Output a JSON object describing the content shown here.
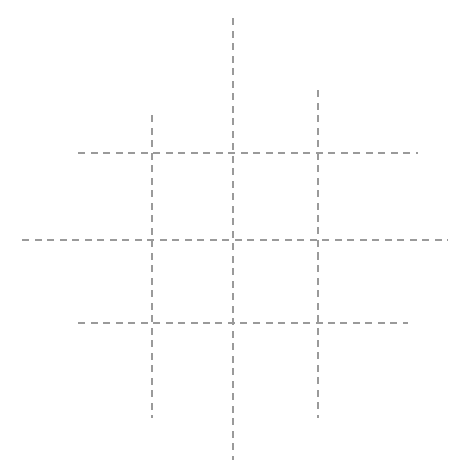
{
  "figure": {
    "background_color": "#ffffff",
    "width": 466,
    "height": 476,
    "caption_partial": "clipped caption text at bottom edge"
  },
  "style": {
    "line_color": "#9a9a9a",
    "line_width": 1.4,
    "dash_on": 7,
    "dash_off": 5.5,
    "linecap": "butt"
  },
  "chart_data": {
    "type": "line",
    "xlabel": "",
    "ylabel": "",
    "xlim": [
      0,
      466
    ],
    "ylim": [
      476,
      0
    ],
    "grid": false,
    "legend": "none",
    "series": [
      {
        "name": "vertical-left",
        "orientation": "vertical",
        "x": 152,
        "y_start": 115,
        "y_end": 418
      },
      {
        "name": "vertical-center",
        "orientation": "vertical",
        "x": 233,
        "y_start": 18,
        "y_end": 460
      },
      {
        "name": "vertical-right",
        "orientation": "vertical",
        "x": 318,
        "y_start": 90,
        "y_end": 418
      },
      {
        "name": "horizontal-top",
        "orientation": "horizontal",
        "y": 153,
        "x_start": 78,
        "x_end": 418
      },
      {
        "name": "horizontal-middle",
        "orientation": "horizontal",
        "y": 240,
        "x_start": 22,
        "x_end": 448
      },
      {
        "name": "horizontal-bottom",
        "orientation": "horizontal",
        "y": 323,
        "x_start": 78,
        "x_end": 408
      }
    ],
    "intersections": [
      {
        "x": 152,
        "y": 153
      },
      {
        "x": 233,
        "y": 153
      },
      {
        "x": 318,
        "y": 153
      },
      {
        "x": 152,
        "y": 240
      },
      {
        "x": 233,
        "y": 240
      },
      {
        "x": 318,
        "y": 240
      },
      {
        "x": 152,
        "y": 323
      },
      {
        "x": 233,
        "y": 323
      },
      {
        "x": 318,
        "y": 323
      }
    ]
  },
  "caption": {
    "text": "",
    "top": 468
  }
}
